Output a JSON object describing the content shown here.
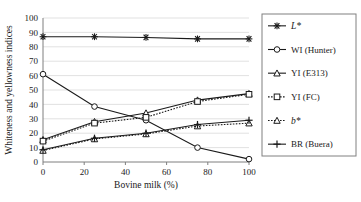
{
  "chart_data": {
    "type": "line",
    "title": "",
    "xlabel": "Bovine milk (%)",
    "ylabel": "Whiteness and yellowness indices",
    "x": [
      0,
      25,
      50,
      75,
      100
    ],
    "xlim": [
      0,
      100
    ],
    "ylim": [
      0,
      100
    ],
    "xticks": [
      "0",
      "20",
      "40",
      "60",
      "80",
      "100"
    ],
    "xtick_values": [
      0,
      20,
      40,
      60,
      80,
      100
    ],
    "yticks": [
      "0",
      "10",
      "20",
      "30",
      "40",
      "50",
      "60",
      "70",
      "80",
      "90",
      "100"
    ],
    "ytick_values": [
      0,
      10,
      20,
      30,
      40,
      50,
      60,
      70,
      80,
      90,
      100
    ],
    "grid": "horizontal",
    "legend_position": "right",
    "series": [
      {
        "name": "L*",
        "italic": true,
        "marker": "asterisk",
        "linestyle": "solid",
        "color": "#1a1a1a",
        "values": [
          87,
          87,
          86.5,
          85.5,
          85.5
        ]
      },
      {
        "name": "WI (Hunter)",
        "italic": false,
        "marker": "circle",
        "linestyle": "solid",
        "color": "#1a1a1a",
        "values": [
          61,
          38.5,
          29,
          10,
          2
        ]
      },
      {
        "name": "YI (E313)",
        "italic": false,
        "marker": "triangle",
        "linestyle": "solid",
        "color": "#1a1a1a",
        "values": [
          15.5,
          28,
          34,
          43,
          47.5
        ]
      },
      {
        "name": "YI (FC)",
        "italic": false,
        "marker": "square",
        "linestyle": "dotted",
        "color": "#1a1a1a",
        "values": [
          14.5,
          27,
          31,
          42,
          47
        ]
      },
      {
        "name": "b*",
        "italic": true,
        "marker": "triangle-open",
        "linestyle": "dotted",
        "color": "#1a1a1a",
        "values": [
          8,
          16,
          19.5,
          25,
          27
        ]
      },
      {
        "name": "BR (Buera)",
        "italic": false,
        "marker": "plus",
        "linestyle": "solid",
        "color": "#1a1a1a",
        "values": [
          8.5,
          16.5,
          20,
          26,
          29
        ]
      }
    ]
  },
  "axes": {
    "x_title": "Bovine milk (%)",
    "y_title": "Whiteness and yellowness indices"
  },
  "legend": {
    "items": [
      {
        "label": "L*",
        "italic": true
      },
      {
        "label": "WI (Hunter)",
        "italic": false
      },
      {
        "label": "YI (E313)",
        "italic": false
      },
      {
        "label": "YI (FC)",
        "italic": false
      },
      {
        "label": "b*",
        "italic": true
      },
      {
        "label": "BR (Buera)",
        "italic": false
      }
    ]
  },
  "style": {
    "line_color": "#1a1a1a",
    "grid_color": "#d9d9d9",
    "axis_color": "#7f7f7f",
    "background": "#ffffff"
  }
}
